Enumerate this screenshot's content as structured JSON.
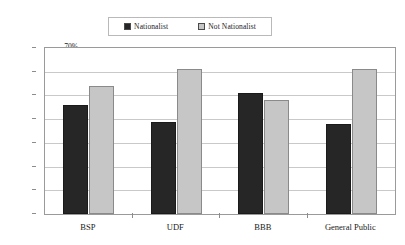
{
  "chart_data": {
    "type": "bar",
    "title": "",
    "subtitle": "",
    "xlabel": "",
    "ylabel": "",
    "categories": [
      "BSP",
      "UDF",
      "BBB",
      "General Public"
    ],
    "series": [
      {
        "name": "Nationalist",
        "values": [
          46,
          39,
          51,
          38
        ],
        "color": "#262626",
        "swatch": "filled-dark-square"
      },
      {
        "name": "Not Nationalist",
        "values": [
          54,
          61,
          48,
          61
        ],
        "color": "#c6c6c6",
        "swatch": "filled-light-square"
      }
    ],
    "ylim": [
      0,
      70
    ],
    "ytick_values": [
      0,
      10,
      20,
      30,
      40,
      50,
      60,
      70
    ],
    "ytick_labels": [
      "0%",
      "10%",
      "20%",
      "30%",
      "40%",
      "50%",
      "60%",
      "70%"
    ],
    "value_format": "percent",
    "grid": "horizontal",
    "legend_position": "top-center",
    "plot_background": "#ffffff",
    "grid_color": "#c9c9c9",
    "axis_color": "#9a9a9a"
  }
}
